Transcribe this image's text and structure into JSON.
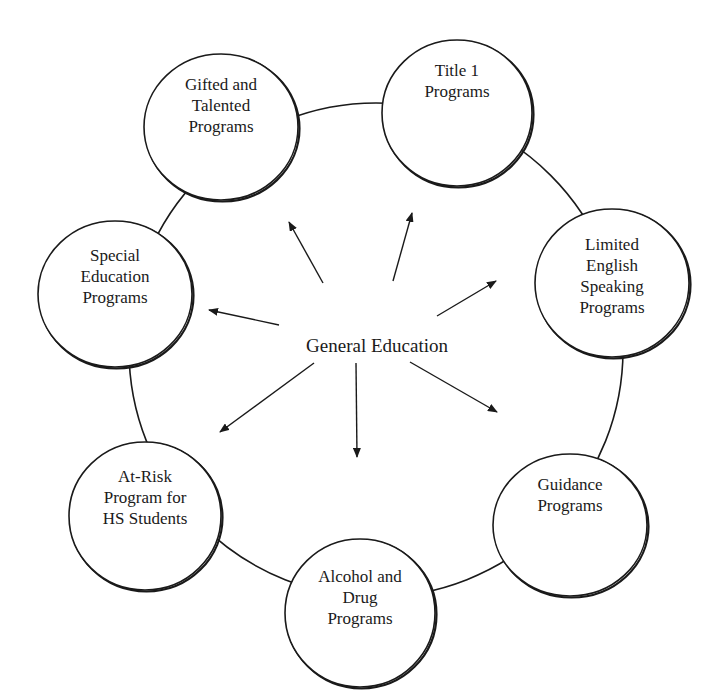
{
  "diagram": {
    "center": {
      "label": "General Education",
      "x": 377,
      "y": 352
    },
    "ring": {
      "cx": 376,
      "cy": 350,
      "r": 247,
      "stroke": "#1a1a1a"
    },
    "nodes": [
      {
        "id": "gifted",
        "lines": [
          "Gifted and",
          "Talented",
          "Programs"
        ],
        "cx": 221,
        "cy": 127,
        "rx": 77,
        "ry": 73,
        "text_y": 90
      },
      {
        "id": "title1",
        "lines": [
          "Title 1",
          "Programs"
        ],
        "cx": 457,
        "cy": 113,
        "rx": 75,
        "ry": 73,
        "text_y": 76
      },
      {
        "id": "limited-english",
        "lines": [
          "Limited",
          "English",
          "Speaking",
          "Programs"
        ],
        "cx": 612,
        "cy": 283,
        "rx": 77,
        "ry": 74,
        "text_y": 250
      },
      {
        "id": "special-education",
        "lines": [
          "Special",
          "Education",
          "Programs"
        ],
        "cx": 115,
        "cy": 294,
        "rx": 77,
        "ry": 73,
        "text_y": 261
      },
      {
        "id": "at-risk",
        "lines": [
          "At-Risk",
          "Program for",
          "HS Students"
        ],
        "cx": 145,
        "cy": 516,
        "rx": 76,
        "ry": 74,
        "text_y": 482
      },
      {
        "id": "alcohol-drug",
        "lines": [
          "Alcohol and",
          "Drug",
          "Programs"
        ],
        "cx": 360,
        "cy": 613,
        "rx": 75,
        "ry": 74,
        "text_y": 582
      },
      {
        "id": "guidance",
        "lines": [
          "Guidance",
          "Programs"
        ],
        "cx": 570,
        "cy": 525,
        "rx": 77,
        "ry": 71,
        "text_y": 490
      }
    ],
    "arrows": [
      {
        "to": "gifted",
        "x1": 323,
        "y1": 283,
        "x2": 289,
        "y2": 222
      },
      {
        "to": "title1",
        "x1": 393,
        "y1": 281,
        "x2": 412,
        "y2": 213
      },
      {
        "to": "limited-english",
        "x1": 437,
        "y1": 316,
        "x2": 496,
        "y2": 281
      },
      {
        "to": "special-education",
        "x1": 279,
        "y1": 325,
        "x2": 209,
        "y2": 310
      },
      {
        "to": "at-risk",
        "x1": 314,
        "y1": 363,
        "x2": 220,
        "y2": 432
      },
      {
        "to": "alcohol-drug",
        "x1": 356,
        "y1": 363,
        "x2": 357,
        "y2": 457
      },
      {
        "to": "guidance",
        "x1": 410,
        "y1": 362,
        "x2": 497,
        "y2": 412
      }
    ]
  }
}
